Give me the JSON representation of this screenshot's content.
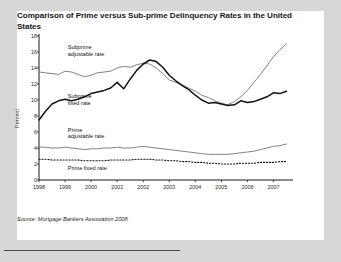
{
  "figure": {
    "title": "Comparison of Prime versus Sub-prime Delinquency Rates in the United States",
    "source": "Source: Mortgage Bankers Association 2008."
  },
  "chart_data": {
    "type": "line",
    "title": "Comparison of Prime versus Sub-prime Delinquency Rates in the United States",
    "xlabel": "",
    "ylabel": "Percent",
    "xlim": [
      1998,
      2007.75
    ],
    "ylim": [
      0,
      18
    ],
    "yticks": [
      0,
      2,
      4,
      6,
      8,
      10,
      12,
      14,
      16,
      18
    ],
    "xticks": [
      1998,
      1999,
      2000,
      2001,
      2002,
      2003,
      2004,
      2005,
      2006,
      2007
    ],
    "grid": false,
    "legend": "inline-annotations",
    "x": [
      1998,
      1998.25,
      1998.5,
      1998.75,
      1999,
      1999.25,
      1999.5,
      1999.75,
      2000,
      2000.25,
      2000.5,
      2000.75,
      2001,
      2001.25,
      2001.5,
      2001.75,
      2002,
      2002.25,
      2002.5,
      2002.75,
      2003,
      2003.25,
      2003.5,
      2003.75,
      2004,
      2004.25,
      2004.5,
      2004.75,
      2005,
      2005.25,
      2005.5,
      2005.75,
      2006,
      2006.25,
      2006.5,
      2006.75,
      2007,
      2007.25,
      2007.5
    ],
    "series": [
      {
        "name": "Subprime adjustable rate",
        "style": "thin-gray-solid",
        "color": "#6b6b6b",
        "values": [
          13.5,
          13.4,
          13.3,
          13.2,
          13.6,
          13.5,
          13.2,
          12.9,
          13.1,
          13.4,
          13.5,
          13.6,
          14.0,
          14.2,
          14.1,
          14.4,
          14.6,
          14.5,
          14.0,
          13.3,
          12.5,
          12.2,
          11.9,
          11.5,
          11.1,
          10.6,
          10.3,
          9.9,
          9.6,
          9.4,
          9.8,
          10.4,
          11.2,
          12.2,
          13.2,
          14.3,
          15.4,
          16.3,
          17.0
        ]
      },
      {
        "name": "Subprime fixed rate",
        "style": "thick-black-solid",
        "color": "#121212",
        "values": [
          7.5,
          8.6,
          9.5,
          9.9,
          10.1,
          9.9,
          10.1,
          10.4,
          10.8,
          11.0,
          11.2,
          11.5,
          12.2,
          11.4,
          12.6,
          13.7,
          14.5,
          15.0,
          14.8,
          14.1,
          13.1,
          12.4,
          11.8,
          11.3,
          10.6,
          10.0,
          9.6,
          9.7,
          9.5,
          9.3,
          9.4,
          9.9,
          9.7,
          9.8,
          10.1,
          10.4,
          10.9,
          10.8,
          11.1
        ]
      },
      {
        "name": "Prime adjustable rate",
        "style": "thin-gray-solid",
        "color": "#6b6b6b",
        "values": [
          4.1,
          4.1,
          4.0,
          4.0,
          4.1,
          4.0,
          3.9,
          3.8,
          3.9,
          3.9,
          4.0,
          4.0,
          4.1,
          4.0,
          4.0,
          4.1,
          4.2,
          4.1,
          4.0,
          3.9,
          3.8,
          3.7,
          3.6,
          3.5,
          3.4,
          3.3,
          3.2,
          3.2,
          3.2,
          3.2,
          3.3,
          3.4,
          3.5,
          3.6,
          3.8,
          4.0,
          4.2,
          4.3,
          4.5
        ]
      },
      {
        "name": "Prime fixed rate",
        "style": "dotted-black",
        "color": "#121212",
        "values": [
          2.6,
          2.6,
          2.5,
          2.5,
          2.5,
          2.5,
          2.5,
          2.4,
          2.4,
          2.4,
          2.4,
          2.5,
          2.5,
          2.5,
          2.5,
          2.6,
          2.6,
          2.6,
          2.5,
          2.5,
          2.4,
          2.4,
          2.3,
          2.3,
          2.2,
          2.2,
          2.1,
          2.1,
          2.0,
          2.0,
          2.0,
          2.1,
          2.1,
          2.1,
          2.2,
          2.2,
          2.2,
          2.3,
          2.3
        ]
      }
    ],
    "annotations": [
      {
        "text": "Subprime\nadjustable rate",
        "x": 1999.1,
        "y": 16.6
      },
      {
        "text": "Subprime\nfixed rate",
        "x": 1999.1,
        "y": 10.5
      },
      {
        "text": "Prime\nadjustable rate",
        "x": 1999.1,
        "y": 6.3
      },
      {
        "text": "Prime fixed rate",
        "x": 1999.1,
        "y": 1.5
      }
    ]
  }
}
